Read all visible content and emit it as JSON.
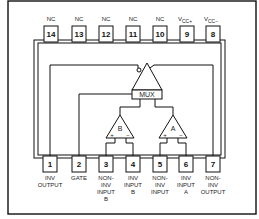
{
  "diagram": {
    "type": "ic-pinout",
    "top_pins": [
      {
        "number": "14",
        "label": "NC"
      },
      {
        "number": "13",
        "label": "NC"
      },
      {
        "number": "12",
        "label": "NC"
      },
      {
        "number": "11",
        "label": "NC"
      },
      {
        "number": "10",
        "label": "NC"
      },
      {
        "number": "9",
        "label": "VCC+",
        "label_main": "V",
        "label_sub": "CC+"
      },
      {
        "number": "8",
        "label": "VCC−",
        "label_main": "V",
        "label_sub": "CC−"
      }
    ],
    "bottom_pins": [
      {
        "number": "1",
        "lines": [
          "INV",
          "OUTPUT"
        ]
      },
      {
        "number": "2",
        "lines": [
          "GATE"
        ]
      },
      {
        "number": "3",
        "lines": [
          "NON-",
          "INV",
          "INPUT",
          "B"
        ]
      },
      {
        "number": "4",
        "lines": [
          "INV",
          "INPUT",
          "B"
        ]
      },
      {
        "number": "5",
        "lines": [
          "NON-",
          "INV",
          "INPUT"
        ]
      },
      {
        "number": "6",
        "lines": [
          "INV",
          "INPUT",
          "A"
        ]
      },
      {
        "number": "7",
        "lines": [
          "NON-",
          "INV",
          "OUTPUT"
        ]
      }
    ],
    "blocks": {
      "mux_label": "MUX",
      "amp_b_label": "B",
      "amp_a_label": "A",
      "plus": "+",
      "minus": "−"
    }
  }
}
